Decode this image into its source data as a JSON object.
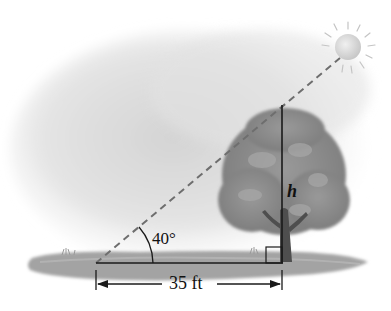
{
  "diagram": {
    "type": "right-triangle-word-problem",
    "angle": {
      "label": "40°",
      "value_degrees": 40
    },
    "height": {
      "label": "h"
    },
    "base": {
      "label": "35 ft",
      "value": 35,
      "unit": "ft"
    },
    "elements": [
      "sun",
      "tree",
      "ground",
      "dashed-sun-ray",
      "right-angle-marker",
      "dimension-arrow"
    ],
    "colors": {
      "line": "#1a1a1a",
      "dashed_ray": "#6e6e6e",
      "sky_haze": "#d9d9d9",
      "ground": "#9a9a9a",
      "foliage": "#8c8c8c",
      "trunk": "#555555",
      "sun": "#d6d6d6"
    }
  }
}
